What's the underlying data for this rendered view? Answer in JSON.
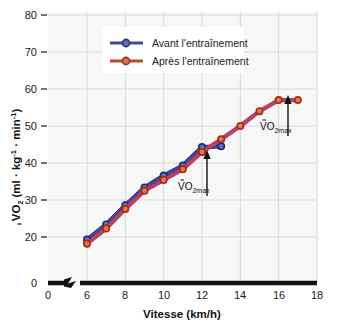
{
  "chart_data": {
    "type": "line",
    "title": "",
    "xlabel": "Vitesse (km/h)",
    "ylabel": "VO2 (ml · kg-1 · min-1)",
    "xlim": [
      0,
      18
    ],
    "ylim": [
      0,
      80
    ],
    "xticks": [
      0,
      6,
      8,
      10,
      12,
      14,
      16,
      18
    ],
    "yticks": [
      0,
      20,
      30,
      40,
      50,
      60,
      70,
      80
    ],
    "axis_break_x": true,
    "axis_break_y": true,
    "grid": true,
    "legend_position": "top-center",
    "series": [
      {
        "name": "Avant l'entraînement",
        "color": "#3d4a96",
        "x": [
          6,
          7,
          8,
          9,
          10,
          11,
          12,
          13
        ],
        "values": [
          19.3,
          23.4,
          28.6,
          33.4,
          36.6,
          39.3,
          44.3,
          44.5
        ]
      },
      {
        "name": "Après l'entraînement",
        "color": "#c14a2b",
        "x": [
          6,
          7,
          8,
          9,
          10,
          11,
          12,
          13,
          14,
          15,
          16,
          17
        ],
        "values": [
          18.2,
          22.3,
          27.6,
          32.5,
          35.4,
          38.3,
          43.0,
          46.4,
          50.0,
          54.0,
          57.0,
          57.0
        ]
      }
    ],
    "annotations": [
      {
        "text": "VO2max",
        "x": 12.6,
        "y": 40.0,
        "series": "Avant l'entraînement"
      },
      {
        "text": "VO2max",
        "x": 16.4,
        "y": 51.5,
        "series": "Après l'entraînement"
      }
    ]
  },
  "axes": {
    "y_tick_labels": [
      "80",
      "70",
      "60",
      "50",
      "40",
      "30",
      "20",
      "0"
    ],
    "x_tick_labels": [
      "0",
      "6",
      "8",
      "10",
      "12",
      "14",
      "16",
      "18"
    ],
    "x_axis_title": "Vitesse (km/h)",
    "y_axis_title_parts": {
      "v_dot": "V",
      "o": "O",
      "two": "2",
      "open": " (ml · kg",
      "sup1": "-1",
      "mid": " · min",
      "sup2": "-1",
      "close": ")"
    }
  },
  "legend": {
    "items": [
      {
        "label": "Avant l'entraînement",
        "color": "#3d4a96"
      },
      {
        "label": "Après l'entraînement",
        "color": "#c14a2b"
      }
    ]
  },
  "annotations": {
    "before_label": "VO",
    "before_sub": "2max",
    "after_label": "VO",
    "after_sub": "2max"
  },
  "colors": {
    "before": "#3d4a96",
    "after": "#c14a2b",
    "plot_bg": "#f7f7f7",
    "grid": "#d8d8d8",
    "axis": "#1a1a1a"
  }
}
